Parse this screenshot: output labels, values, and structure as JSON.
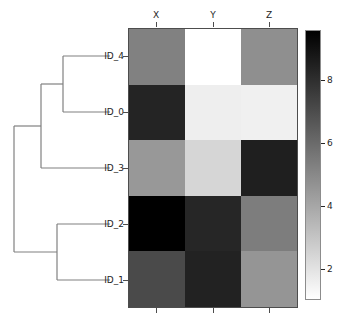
{
  "figure": {
    "kind": "clustered-heatmap-with-dendrogram",
    "background": "#ffffff"
  },
  "chart_data": {
    "type": "heatmap",
    "title": "",
    "xlabel": "",
    "ylabel": "",
    "columns": [
      "X",
      "Y",
      "Z"
    ],
    "rows": [
      "ID_4",
      "ID_0",
      "ID_3",
      "ID_2",
      "ID_1"
    ],
    "values": [
      [
        4.5,
        1.0,
        3.7
      ],
      [
        8.2,
        1.6,
        1.5
      ],
      [
        3.3,
        2.3,
        8.4
      ],
      [
        9.6,
        8.1,
        4.6
      ],
      [
        6.6,
        8.6,
        3.4
      ]
    ],
    "colormap": "gray_r",
    "vmin": 1.0,
    "vmax": 9.6,
    "colorbar": {
      "orientation": "vertical",
      "position": "right",
      "ticks": [
        2,
        4,
        6,
        8
      ],
      "tick_labels": [
        "2",
        "4",
        "6",
        "8"
      ],
      "low_color": "#ffffff",
      "high_color": "#000000"
    },
    "grid": false,
    "legend_position": "right-colorbar",
    "dendrogram": {
      "orientation": "left",
      "leaf_order": [
        "ID_4",
        "ID_0",
        "ID_3",
        "ID_2",
        "ID_1"
      ],
      "line_color": "#808080",
      "merges": [
        {
          "name": "merge-id4-id0",
          "members": [
            "ID_4",
            "ID_0"
          ]
        },
        {
          "name": "merge-id4id0-id3",
          "members": [
            "ID_4",
            "ID_0",
            "ID_3"
          ]
        },
        {
          "name": "merge-id2-id1",
          "members": [
            "ID_2",
            "ID_1"
          ]
        },
        {
          "name": "merge-root",
          "members": [
            "ID_4",
            "ID_0",
            "ID_3",
            "ID_2",
            "ID_1"
          ]
        }
      ]
    }
  },
  "cell_colors": [
    [
      "#818181",
      "#ffffff",
      "#8f8f8f"
    ],
    [
      "#242424",
      "#eeeeee",
      "#f0f0f0"
    ],
    [
      "#989898",
      "#d6d6d6",
      "#1f1f1f"
    ],
    [
      "#000000",
      "#262626",
      "#7d7d7d"
    ],
    [
      "#4a4a4a",
      "#222222",
      "#959595"
    ]
  ]
}
